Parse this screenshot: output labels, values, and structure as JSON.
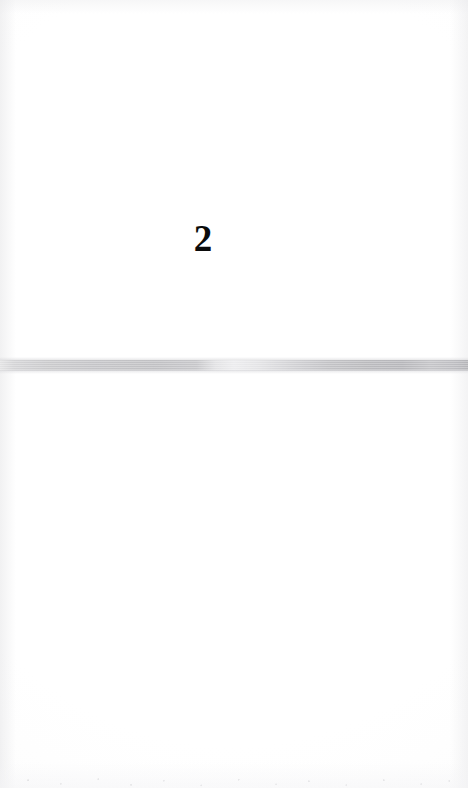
{
  "document": {
    "type": "scanned-page",
    "page_number": "2",
    "background_color": "#ffffff",
    "text_color": "#0b0b0b",
    "body_text": "",
    "content_note": "Blank scanned book page — no body text, headings, figures or captions are present."
  },
  "artifacts": {
    "scan_band": {
      "name": "horizontal-scan-band",
      "description": "Full-width horizontal gray streak across the page from a scanner or page-fold shadow",
      "top_px": 357,
      "height_px": 17,
      "left_tone": "#e3e3e4",
      "gap_tone": "#ececee",
      "right_tone": "#b4b4b8"
    },
    "paper_tone": "#fdfdfd",
    "edge_shadow_color": "#e6e6e8",
    "speckle_color": "#d0d0d2"
  }
}
